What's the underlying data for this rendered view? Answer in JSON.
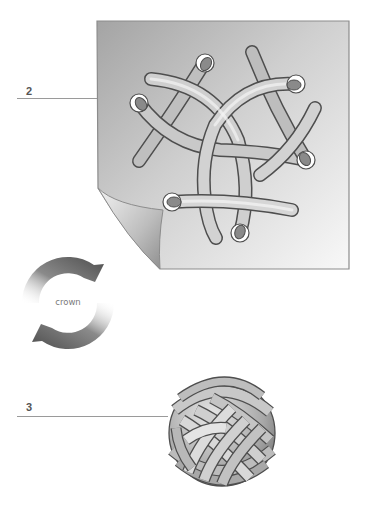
{
  "steps": [
    {
      "number": "2",
      "label_pos": {
        "x": 26,
        "y": 86
      },
      "line": {
        "x1": 17,
        "x2": 97,
        "y": 98
      }
    },
    {
      "number": "3",
      "label_pos": {
        "x": 26,
        "y": 402
      },
      "line": {
        "x1": 17,
        "x2": 168,
        "y": 416
      }
    }
  ],
  "crown_symbol": {
    "label": "crown",
    "center": {
      "x": 68,
      "y": 303
    },
    "outer_radius": 46,
    "inner_radius": 29
  },
  "sheet": {
    "x": 97,
    "y": 21,
    "width": 252,
    "height": 248,
    "color_dark": "#a6a6a6",
    "color_light": "#f6f6f6",
    "border_color": "#8c8c8c"
  },
  "colors": {
    "strand_outline": "#4e4e4e",
    "strand_dark": "#7c7c7c",
    "strand_light": "#f2f2f2",
    "hole_fill": "#ffffff",
    "arrow_dark": "#505050",
    "label_text": "#555555"
  }
}
